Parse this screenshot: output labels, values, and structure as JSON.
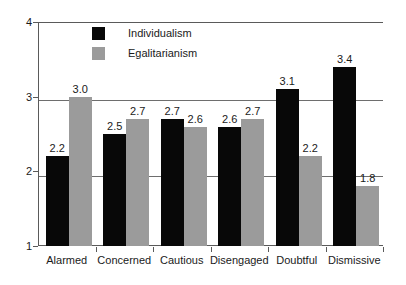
{
  "chart_data": {
    "type": "bar",
    "title": "",
    "subtitle": "",
    "xlabel": "",
    "ylabel": "",
    "categories": [
      "Alarmed",
      "Concerned",
      "Cautious",
      "Disengaged",
      "Doubtful",
      "Dismissive"
    ],
    "series": [
      {
        "name": "Individualism",
        "color": "#080808",
        "values": [
          2.2,
          2.5,
          2.7,
          2.6,
          3.1,
          3.4
        ],
        "labels": [
          "2.2",
          "2.5",
          "2.7",
          "2.6",
          "3.1",
          "3.4"
        ]
      },
      {
        "name": "Egalitarianism",
        "color": "#9b9b9b",
        "values": [
          3.0,
          2.7,
          2.6,
          2.7,
          2.2,
          1.8
        ],
        "labels": [
          "3.0",
          "2.7",
          "2.6",
          "2.7",
          "2.2",
          "1.8"
        ]
      }
    ],
    "ylim": [
      1,
      4
    ],
    "yticks": [
      1,
      2,
      3,
      4
    ],
    "ytick_labels": [
      "1",
      "2",
      "3",
      "4"
    ],
    "grid": true,
    "grid_axis": "y",
    "legend_position": "top-center-inside",
    "bar_gap": 0,
    "group_gap": true
  },
  "legend": {
    "entries": [
      {
        "label": "Individualism",
        "swatch": "legend-swatch-black"
      },
      {
        "label": "Egalitarianism",
        "swatch": "legend-swatch-gray"
      }
    ]
  }
}
